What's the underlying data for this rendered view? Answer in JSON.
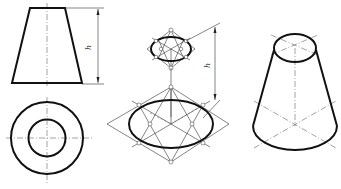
{
  "figure": {
    "views": [
      {
        "name": "front-view",
        "label": "Front view (trapezoid)"
      },
      {
        "name": "top-view",
        "label": "Top view (concentric circles)"
      },
      {
        "name": "isometric-construction",
        "label": "Four-center ellipse construction"
      },
      {
        "name": "isometric-result",
        "label": "Isometric truncated cone"
      }
    ],
    "dimension_label": "h",
    "dimension_label_2": "h"
  }
}
